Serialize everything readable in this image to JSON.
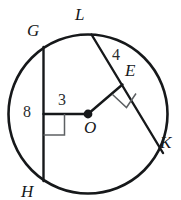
{
  "figure": {
    "kind": "circle-geometry-diagram",
    "stroke_color": "#16181a",
    "background_color": "#ffffff",
    "measure_color": "#2a2c2e"
  },
  "circle": {
    "name": "circle-O",
    "center_x": 88,
    "center_y": 114,
    "radius": 80
  },
  "center_point": {
    "label": "O",
    "x": 88,
    "y": 114,
    "dot_radius": 4.2
  },
  "points": [
    {
      "id": "G",
      "label": "G",
      "x": 43,
      "y": 48,
      "label_x": 27,
      "label_y": 22
    },
    {
      "id": "L",
      "label": "L",
      "x": 92,
      "y": 35,
      "label_x": 75,
      "label_y": 6
    },
    {
      "id": "E",
      "label": "E",
      "x": 122,
      "y": 85,
      "label_x": 125,
      "label_y": 62
    },
    {
      "id": "K",
      "label": "K",
      "x": 162,
      "y": 152,
      "label_x": 160,
      "label_y": 134
    },
    {
      "id": "H",
      "label": "H",
      "x": 43,
      "y": 180,
      "label_x": 21,
      "label_y": 183
    }
  ],
  "chords": [
    {
      "id": "GH",
      "from": "G",
      "to": "H",
      "x1": 43,
      "y1": 48,
      "x2": 43,
      "y2": 180
    },
    {
      "id": "LK",
      "from": "L",
      "to": "K",
      "x1": 92,
      "y1": 35,
      "x2": 162,
      "y2": 152
    }
  ],
  "segments": [
    {
      "id": "O-to-GH",
      "label": "3",
      "x1": 88,
      "y1": 114,
      "x2": 43,
      "y2": 114,
      "label_x": 58,
      "label_y": 92
    },
    {
      "id": "O-to-E",
      "label": "4",
      "x1": 88,
      "y1": 114,
      "x2": 122,
      "y2": 85,
      "label_x": 112,
      "label_y": 47
    }
  ],
  "measures": [
    {
      "id": "seg-8",
      "label": "8",
      "meaning": "half-chord-GH",
      "label_x": 23,
      "label_y": 104
    },
    {
      "id": "seg-3",
      "label": "3",
      "meaning": "distance-center-to-chord-GH",
      "label_x": 58,
      "label_y": 92
    },
    {
      "id": "seg-4",
      "label": "4",
      "meaning": "half-chord-LK",
      "label_x": 112,
      "label_y": 47
    }
  ],
  "right_angle_marks": [
    {
      "id": "right-angle-at-GH",
      "style": "axis-aligned-square",
      "x": 43,
      "y": 114,
      "size": 21
    },
    {
      "id": "right-angle-at-E",
      "style": "rotated-square",
      "x": 122,
      "y": 85,
      "size": 19
    }
  ]
}
